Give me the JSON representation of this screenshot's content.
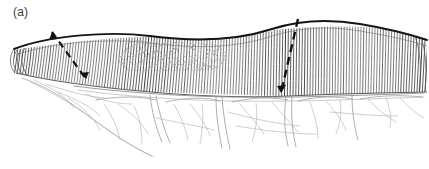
{
  "figure": {
    "panel_label": "(a)",
    "background_color": "#ffffff",
    "width": 429,
    "height": 169
  },
  "colors": {
    "ink_dark": "#1a1a1a",
    "ink_mid": "#555555",
    "ink_light": "#8e8e8e",
    "ink_faint": "#b4b4b4",
    "stipple": "#9a9a9a",
    "label_text": "#3b3b3b",
    "background": "#ffffff"
  },
  "elements": {
    "bowel_wall": {
      "name": "bowel-segment",
      "description": "hatched tubular bowel segment running left to right",
      "top_contour": "M 14 48 C 50 34, 110 30, 150 35 C 195 41, 235 40, 272 28 C 300 19, 330 18, 360 23 C 390 28, 412 34, 424 38",
      "bottom_contour": "M 16 72 C 50 80, 96 86, 140 90 C 190 95, 245 97, 290 95 C 330 93, 380 92, 424 90",
      "hatch_count": 150,
      "hatch_color": "#3a3a3a"
    },
    "tumor_lesion": {
      "name": "tumor-stipple-region",
      "description": "stippled pathological lesion on bowel surface",
      "bounds": [
        118,
        40,
        108,
        32
      ],
      "dot_count": 430,
      "dot_color": "#8c8c8c"
    },
    "resection_line_left": {
      "name": "resection-line-left",
      "description": "dashed proximal resection margin with arrow",
      "from": [
        52,
        32
      ],
      "to": [
        86,
        79
      ],
      "dash": "7 5",
      "color": "#121212",
      "width": 2.2
    },
    "resection_line_right": {
      "name": "resection-line-right",
      "description": "dashed distal resection margin",
      "from": [
        298,
        19
      ],
      "to": [
        281,
        93
      ],
      "dash": "7 5",
      "color": "#121212",
      "width": 2.4
    },
    "mesentery": {
      "name": "mesentery-region",
      "description": "fan-shaped mesentery below bowel with vascular arcades",
      "vessel_color": "#a0a0a0",
      "arcade_count": 5
    }
  }
}
